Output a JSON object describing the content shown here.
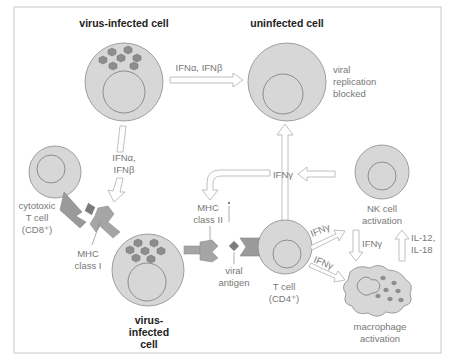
{
  "diagram": {
    "type": "immunology-schematic",
    "colors": {
      "background": "#ffffff",
      "frame": "#c8c8c8",
      "cell_fill": "#d7d7d7",
      "virus_fill": "#8d8d8d",
      "receptor_fill": "#a5a5a5",
      "arrow_outline": "#b9b9b9",
      "label_text": "#777777",
      "title_text": "#222222"
    },
    "cells": {
      "infected_top": {
        "title": "virus-infected cell"
      },
      "uninfected": {
        "title": "uninfected cell",
        "note_lines": [
          "viral",
          "replication",
          "blocked"
        ]
      },
      "cytotoxic": {
        "label_lines": [
          "cytotoxic",
          "T cell",
          "(CD8⁺)"
        ]
      },
      "infected_bottom": {
        "title_lines": [
          "virus-",
          "infected",
          "cell"
        ]
      },
      "t_cell": {
        "label_lines": [
          "T cell",
          "(CD4⁺)"
        ]
      },
      "nk_cell": {
        "label_lines": [
          "NK cell",
          "activation"
        ]
      },
      "macrophage": {
        "label_lines": [
          "macrophage",
          "activation"
        ]
      }
    },
    "molecules": {
      "mhc_class_1": [
        "MHC",
        "class I"
      ],
      "mhc_class_2": [
        "MHC",
        "class II"
      ],
      "viral_antigen": [
        "viral",
        "antigen"
      ]
    },
    "signals": {
      "top_horizontal": "IFNα, IFNβ",
      "left_vertical": [
        "IFNα,",
        "IFNβ"
      ],
      "center_ifn_gamma": "IFNγ",
      "tcell_to_nk": "IFNγ",
      "tcell_to_macrophage": "IFNγ",
      "nk_to_macrophage": "IFNγ",
      "macrophage_to_nk": [
        "IL-12,",
        "IL-18"
      ]
    }
  }
}
